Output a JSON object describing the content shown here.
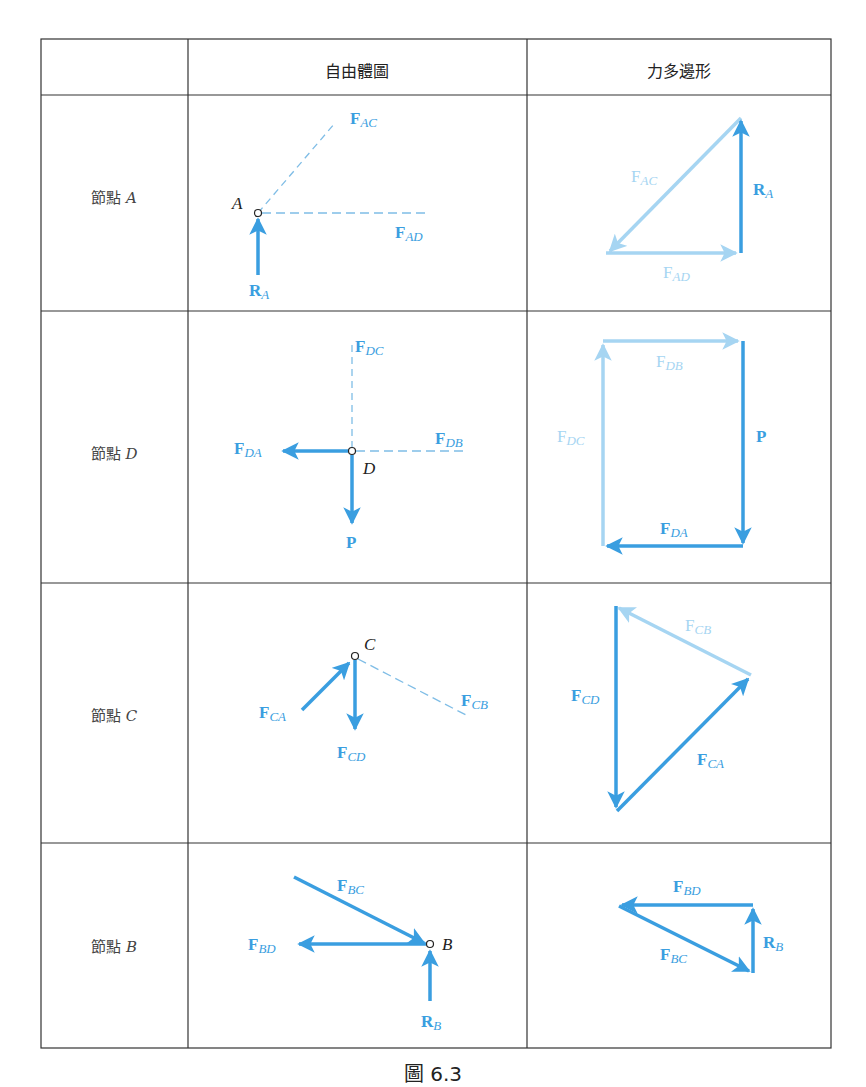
{
  "table": {
    "headers": [
      "",
      "自由體圖",
      "力多邊形"
    ],
    "rows": [
      {
        "label_prefix": "節點",
        "node": "A",
        "fbd": {
          "node_label": "A",
          "forces": [
            {
              "name": "F",
              "sub": "AC",
              "style": "dashed"
            },
            {
              "name": "F",
              "sub": "AD",
              "style": "dashed"
            },
            {
              "name": "R",
              "sub": "A",
              "style": "arrow"
            }
          ]
        },
        "polygon": {
          "forces": [
            {
              "name": "F",
              "sub": "AC",
              "shade": "light"
            },
            {
              "name": "R",
              "sub": "A",
              "shade": "dark"
            },
            {
              "name": "F",
              "sub": "AD",
              "shade": "light"
            }
          ]
        }
      },
      {
        "label_prefix": "節點",
        "node": "D",
        "fbd": {
          "node_label": "D",
          "forces": [
            {
              "name": "F",
              "sub": "DC",
              "style": "dashed"
            },
            {
              "name": "F",
              "sub": "DB",
              "style": "dashed"
            },
            {
              "name": "F",
              "sub": "DA",
              "style": "arrow"
            },
            {
              "name": "P",
              "sub": "",
              "style": "arrow"
            }
          ]
        },
        "polygon": {
          "forces": [
            {
              "name": "F",
              "sub": "DB",
              "shade": "light"
            },
            {
              "name": "F",
              "sub": "DC",
              "shade": "light"
            },
            {
              "name": "P",
              "sub": "",
              "shade": "dark"
            },
            {
              "name": "F",
              "sub": "DA",
              "shade": "dark"
            }
          ]
        }
      },
      {
        "label_prefix": "節點",
        "node": "C",
        "fbd": {
          "node_label": "C",
          "forces": [
            {
              "name": "F",
              "sub": "CA",
              "style": "arrow"
            },
            {
              "name": "F",
              "sub": "CD",
              "style": "arrow"
            },
            {
              "name": "F",
              "sub": "CB",
              "style": "dashed"
            }
          ]
        },
        "polygon": {
          "forces": [
            {
              "name": "F",
              "sub": "CB",
              "shade": "light"
            },
            {
              "name": "F",
              "sub": "CD",
              "shade": "dark"
            },
            {
              "name": "F",
              "sub": "CA",
              "shade": "dark"
            }
          ]
        }
      },
      {
        "label_prefix": "節點",
        "node": "B",
        "fbd": {
          "node_label": "B",
          "forces": [
            {
              "name": "F",
              "sub": "BC",
              "style": "arrow"
            },
            {
              "name": "F",
              "sub": "BD",
              "style": "arrow"
            },
            {
              "name": "R",
              "sub": "B",
              "style": "arrow"
            }
          ]
        },
        "polygon": {
          "forces": [
            {
              "name": "F",
              "sub": "BD",
              "shade": "dark"
            },
            {
              "name": "F",
              "sub": "BC",
              "shade": "dark"
            },
            {
              "name": "R",
              "sub": "B",
              "shade": "dark"
            }
          ]
        }
      }
    ]
  },
  "caption": "圖 6.3",
  "colors": {
    "dark_blue": "#3a9ee0",
    "light_blue": "#a6d5f2",
    "dashed_blue": "#7fbde6",
    "border": "#333333",
    "node_text": "#222222"
  }
}
